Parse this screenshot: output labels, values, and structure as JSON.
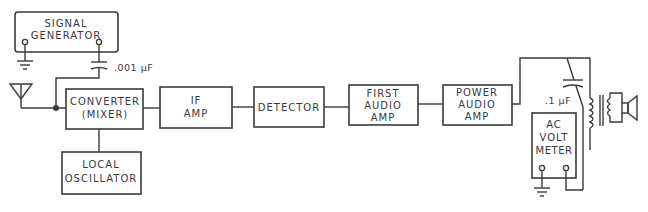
{
  "diagram": {
    "type": "block-diagram",
    "colors": {
      "line": "#3a3a3a",
      "background": "#ffffff"
    },
    "blocks": {
      "signal_generator": {
        "line1": "SIGNAL",
        "line2": "GENERATOR"
      },
      "converter": {
        "line1": "CONVERTER",
        "line2": "(MIXER)"
      },
      "local_oscillator": {
        "line1": "LOCAL",
        "line2": "OSCILLATOR"
      },
      "if_amp": {
        "line1": "IF",
        "line2": "AMP"
      },
      "detector": {
        "line1": "DETECTOR"
      },
      "first_audio_amp": {
        "line1": "FIRST",
        "line2": "AUDIO",
        "line3": "AMP"
      },
      "power_audio_amp": {
        "line1": "POWER",
        "line2": "AUDIO",
        "line3": "AMP"
      },
      "ac_volt_meter": {
        "line1": "AC",
        "line2": "VOLT",
        "line3": "METER"
      }
    },
    "components": {
      "input_capacitor": {
        "label": ".001 μF"
      },
      "output_capacitor": {
        "label": ".1 μF"
      },
      "antenna": {
        "symbol": "antenna-icon"
      },
      "ground_generator": {
        "symbol": "ground-icon"
      },
      "ground_meter": {
        "symbol": "ground-icon"
      },
      "output_transformer": {
        "symbol": "transformer-icon"
      },
      "speaker": {
        "symbol": "speaker-icon"
      }
    },
    "signal_chain": [
      "SIGNAL GENERATOR",
      "CONVERTER (MIXER)",
      "IF AMP",
      "DETECTOR",
      "FIRST AUDIO AMP",
      "POWER AUDIO AMP",
      "SPEAKER"
    ]
  }
}
